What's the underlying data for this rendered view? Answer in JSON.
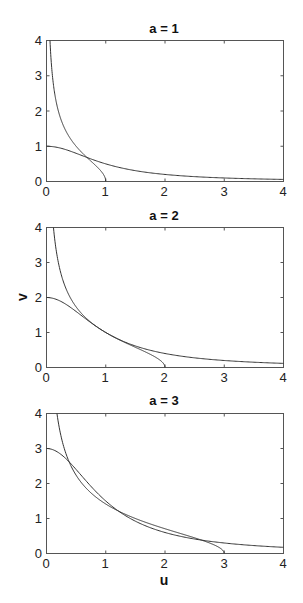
{
  "chart_data": [
    {
      "type": "line",
      "title": "a = 1",
      "xlabel": "",
      "ylabel": "",
      "xlim": [
        0,
        4
      ],
      "ylim": [
        0,
        4
      ],
      "xticks": [
        "0",
        "1",
        "2",
        "3",
        "4"
      ],
      "yticks": [
        "0",
        "1",
        "2",
        "3",
        "4"
      ],
      "grid": false,
      "legend": null,
      "a": 1,
      "series": [
        {
          "name": "v = a/(1+u^2)",
          "x": [
            0,
            0.25,
            0.5,
            0.75,
            1,
            1.5,
            2,
            2.5,
            3,
            3.5,
            4
          ],
          "values": [
            1,
            0.94,
            0.8,
            0.64,
            0.5,
            0.31,
            0.2,
            0.14,
            0.1,
            0.08,
            0.06
          ]
        },
        {
          "name": "v = sqrt((a-u)/u)",
          "x": [
            0.06,
            0.1,
            0.2,
            0.3,
            0.4,
            0.5,
            0.6,
            0.7,
            0.8,
            0.9,
            1.0
          ],
          "values": [
            3.96,
            3.0,
            2.0,
            1.53,
            1.22,
            1.0,
            0.82,
            0.65,
            0.5,
            0.33,
            0
          ]
        }
      ]
    },
    {
      "type": "line",
      "title": "a = 2",
      "xlabel": "",
      "ylabel": "v",
      "xlim": [
        0,
        4
      ],
      "ylim": [
        0,
        4
      ],
      "xticks": [
        "0",
        "1",
        "2",
        "3",
        "4"
      ],
      "yticks": [
        "0",
        "1",
        "2",
        "3",
        "4"
      ],
      "grid": false,
      "legend": null,
      "a": 2,
      "series": [
        {
          "name": "v = a/(1+u^2)",
          "x": [
            0,
            0.25,
            0.5,
            0.75,
            1,
            1.5,
            2,
            2.5,
            3,
            3.5,
            4
          ],
          "values": [
            2,
            1.88,
            1.6,
            1.28,
            1.0,
            0.62,
            0.4,
            0.28,
            0.2,
            0.15,
            0.12
          ]
        },
        {
          "name": "v = sqrt((a-u)/u)",
          "x": [
            0.12,
            0.2,
            0.4,
            0.6,
            0.8,
            1.0,
            1.2,
            1.4,
            1.6,
            1.8,
            2.0
          ],
          "values": [
            3.96,
            3.0,
            2.0,
            1.53,
            1.22,
            1.0,
            0.82,
            0.65,
            0.5,
            0.33,
            0
          ]
        }
      ]
    },
    {
      "type": "line",
      "title": "a = 3",
      "xlabel": "u",
      "ylabel": "",
      "xlim": [
        0,
        4
      ],
      "ylim": [
        0,
        4
      ],
      "xticks": [
        "0",
        "1",
        "2",
        "3",
        "4"
      ],
      "yticks": [
        "0",
        "1",
        "2",
        "3",
        "4"
      ],
      "grid": false,
      "legend": null,
      "a": 3,
      "series": [
        {
          "name": "v = a/(1+u^2)",
          "x": [
            0,
            0.25,
            0.5,
            0.75,
            1,
            1.5,
            2,
            2.5,
            3,
            3.5,
            4
          ],
          "values": [
            3,
            2.82,
            2.4,
            1.92,
            1.5,
            0.92,
            0.6,
            0.41,
            0.3,
            0.23,
            0.18
          ]
        },
        {
          "name": "v = sqrt((a-u)/u)",
          "x": [
            0.18,
            0.3,
            0.6,
            0.9,
            1.2,
            1.5,
            1.8,
            2.1,
            2.4,
            2.7,
            3.0
          ],
          "values": [
            3.96,
            3.0,
            2.0,
            1.53,
            1.22,
            1.0,
            0.82,
            0.65,
            0.5,
            0.33,
            0
          ]
        }
      ]
    }
  ],
  "figure": {
    "panels": [
      {
        "title": "a = 1",
        "a": 1
      },
      {
        "title": "a = 2",
        "a": 2,
        "ylabel": "v"
      },
      {
        "title": "a = 3",
        "a": 3,
        "xlabel": "u"
      }
    ],
    "tick_labels": [
      "0",
      "1",
      "2",
      "3",
      "4"
    ]
  }
}
